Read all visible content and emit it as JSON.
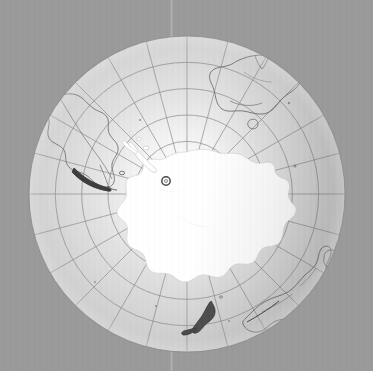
{
  "app": {
    "title": "Orthographic Globe Viewer",
    "background_color": "#9a9a9a"
  },
  "view": {
    "projection": "orthographic",
    "center_label": "South Pole",
    "center_lat": -90,
    "center_lon": 0,
    "globe_center_x": 187,
    "globe_center_y": 194,
    "globe_radius": 158,
    "ocean_color": "#d6d6d6",
    "land_stroke_color": "#6f6f6f",
    "ice_fill_color": "#ffffff",
    "graticule_color": "#8d8d8d",
    "limb_color": "#8a8a8a"
  },
  "graticule": {
    "meridian_step_deg": 30,
    "parallel_step_deg": 15,
    "meridian_labels": [
      "0",
      "30E",
      "60E",
      "90E",
      "120E",
      "150E",
      "180",
      "150W",
      "120W",
      "90W",
      "60W",
      "30W"
    ],
    "parallel_labels": [
      "-15",
      "-30",
      "-45",
      "-60",
      "-75"
    ]
  },
  "rotation_axis": {
    "visible": true,
    "color": "#b8b8b8",
    "x": 172,
    "top_y": 0,
    "bottom_y": 371
  },
  "marker": {
    "name": "site-marker",
    "shape": "circle",
    "x": 166,
    "y": 181,
    "radius": 4.2,
    "stroke_color": "#4a4a4a",
    "fill": "none",
    "label": ""
  },
  "landmasses": [
    {
      "name": "antarctica",
      "type": "ice-sheet",
      "fill": "#ffffff"
    },
    {
      "name": "south-america",
      "type": "continent",
      "fill": "none"
    },
    {
      "name": "australia",
      "type": "continent",
      "fill": "none"
    },
    {
      "name": "tasmania",
      "type": "island",
      "fill": "none"
    },
    {
      "name": "new-zealand",
      "type": "island",
      "fill": "none"
    },
    {
      "name": "southern-africa",
      "type": "continent",
      "fill": "none"
    },
    {
      "name": "madagascar",
      "type": "island",
      "fill": "none"
    },
    {
      "name": "falkland-islands",
      "type": "island",
      "fill": "none"
    }
  ]
}
